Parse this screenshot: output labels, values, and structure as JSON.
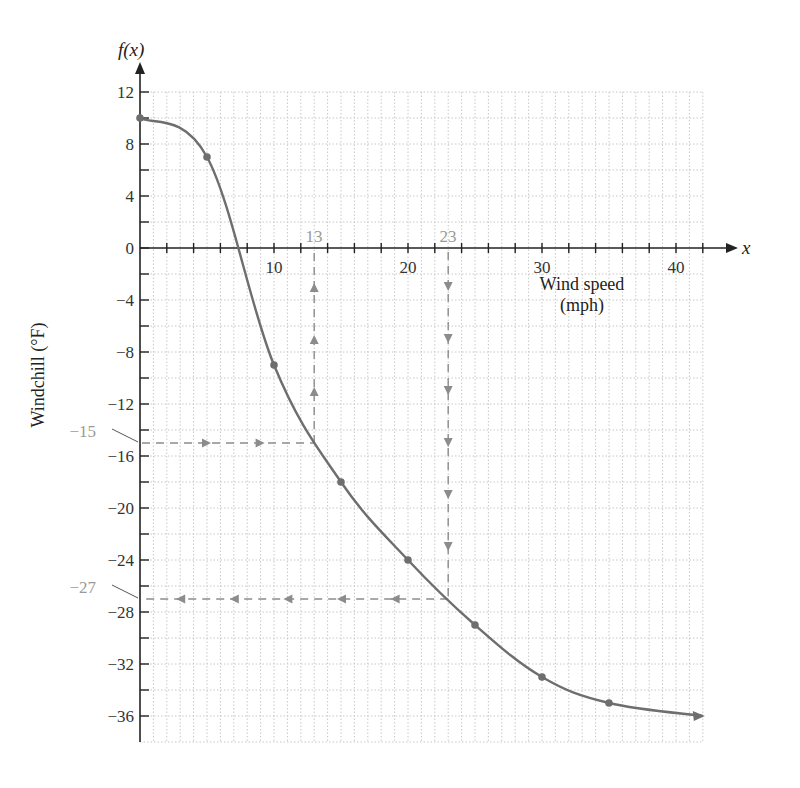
{
  "chart_data": {
    "type": "line",
    "title": "",
    "xlabel": "Wind speed (mph)",
    "xlabel_lines": [
      "Wind speed",
      "(mph)"
    ],
    "ylabel": "Windchill (°F)",
    "x_var": "x",
    "y_var": "f(x)",
    "xlim": [
      0,
      42
    ],
    "ylim": [
      -38,
      12
    ],
    "x_ticks": [
      10,
      20,
      30,
      40
    ],
    "y_ticks": [
      12,
      8,
      4,
      0,
      -4,
      -8,
      -12,
      -16,
      -20,
      -24,
      -28,
      -32,
      -36
    ],
    "x_tick_labels": [
      "10",
      "20",
      "30",
      "40"
    ],
    "y_tick_labels": [
      "12",
      "8",
      "4",
      "0",
      "−4",
      "−8",
      "−12",
      "−16",
      "−20",
      "−24",
      "−28",
      "−32",
      "−36"
    ],
    "grid": true,
    "series": [
      {
        "name": "Windchill",
        "x": [
          0,
          5,
          10,
          15,
          20,
          25,
          30,
          35
        ],
        "y": [
          10,
          7,
          -9,
          -18,
          -24,
          -29,
          -33,
          -35
        ],
        "continues_to": {
          "x": 42,
          "y": -36
        }
      }
    ],
    "annotations": [
      {
        "type": "dashed-lookup",
        "from": "y",
        "y_value": -15,
        "x_value": 13,
        "label_y": "−15",
        "label_x": "13",
        "direction": "y-to-x"
      },
      {
        "type": "dashed-lookup",
        "from": "x",
        "x_value": 23,
        "y_value": -27,
        "label_x": "23",
        "label_y": "−27",
        "direction": "x-to-y"
      }
    ],
    "legend": null
  },
  "labels": {
    "y_var": "f(x)",
    "x_var": "x",
    "ylabel": "Windchill (°F)",
    "xlabel_line1": "Wind speed",
    "xlabel_line2": "(mph)",
    "anno_13": "13",
    "anno_23": "23",
    "anno_m15": "−15",
    "anno_m27": "−27"
  },
  "colors": {
    "curve": "#6e6e6e",
    "axis": "#222222",
    "grid": "#c8c8c8",
    "annotation": "#8c8c8c"
  }
}
